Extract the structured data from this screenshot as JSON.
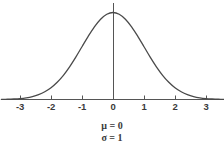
{
  "chart_data": {
    "type": "line",
    "title": "",
    "subtitle": "",
    "xlabel": "",
    "ylabel": "",
    "xlim": [
      -3.6,
      3.6
    ],
    "ylim": [
      0,
      0.43
    ],
    "grid": false,
    "legend_position": "none",
    "distribution": "normal",
    "mu": 0,
    "sigma": 1,
    "x_tick_labels": [
      "-3",
      "-2",
      "-1",
      "0",
      "1",
      "2",
      "3"
    ],
    "x_tick_values": [
      -3,
      -2,
      -1,
      0,
      1,
      2,
      3
    ],
    "y_tick_labels": [],
    "series": [
      {
        "name": "standard normal pdf",
        "x": [
          -3.6,
          -3.4,
          -3.2,
          -3.0,
          -2.8,
          -2.6,
          -2.4,
          -2.2,
          -2.0,
          -1.8,
          -1.6,
          -1.4,
          -1.2,
          -1.0,
          -0.8,
          -0.6,
          -0.4,
          -0.2,
          0.0,
          0.2,
          0.4,
          0.6,
          0.8,
          1.0,
          1.2,
          1.4,
          1.6,
          1.8,
          2.0,
          2.2,
          2.4,
          2.6,
          2.8,
          3.0,
          3.2,
          3.4,
          3.6
        ],
        "values": [
          0.0006,
          0.0012,
          0.0024,
          0.0044,
          0.0079,
          0.0136,
          0.0224,
          0.0355,
          0.054,
          0.079,
          0.1109,
          0.1497,
          0.1942,
          0.242,
          0.2897,
          0.3332,
          0.3683,
          0.391,
          0.3989,
          0.391,
          0.3683,
          0.3332,
          0.2897,
          0.242,
          0.1942,
          0.1497,
          0.1109,
          0.079,
          0.054,
          0.0355,
          0.0224,
          0.0136,
          0.0079,
          0.0044,
          0.0024,
          0.0012,
          0.0006
        ]
      }
    ],
    "annotations": [
      "μ = 0",
      "σ = 1"
    ],
    "colors": {
      "background": "#ffffff",
      "curve": "#4a4a4a",
      "axis": "#555555",
      "text": "#3a3a3a"
    }
  },
  "axis": {
    "x_ticks": [
      {
        "label": "-3",
        "x": 20
      },
      {
        "label": "-2",
        "x": 51
      },
      {
        "label": "-1",
        "x": 82
      },
      {
        "label": "0",
        "x": 113
      },
      {
        "label": "1",
        "x": 144
      },
      {
        "label": "2",
        "x": 175
      },
      {
        "label": "3",
        "x": 206
      }
    ]
  },
  "annotations": {
    "mu_line": "μ = 0",
    "sigma_line": "σ = 1"
  }
}
